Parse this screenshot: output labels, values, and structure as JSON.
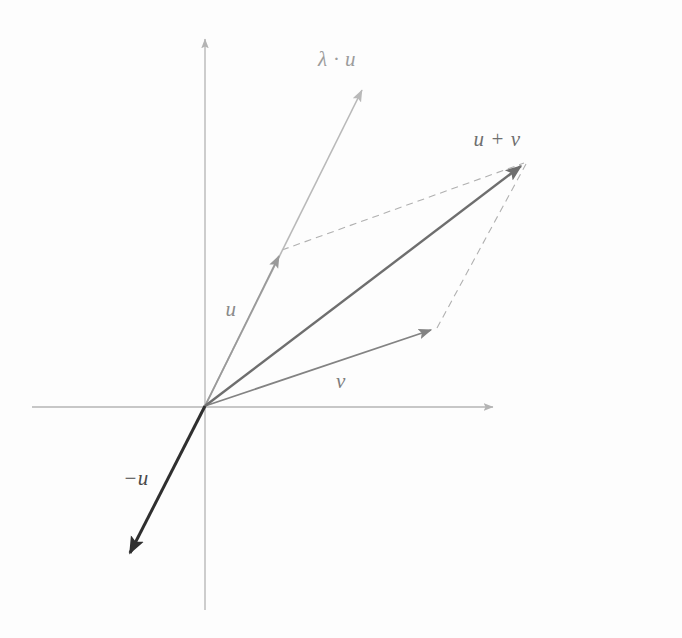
{
  "figure": {
    "background_color": "#fdfdfd",
    "width": 682,
    "height": 638
  },
  "axes": {
    "origin": {
      "x": 205,
      "y": 406
    },
    "color": "#b4b4b4",
    "x_axis": {
      "name": "horizontal-axis",
      "from": {
        "x": 32,
        "y": 407
      },
      "to": {
        "x": 497,
        "y": 407
      },
      "arrow": "right"
    },
    "y_axis": {
      "name": "vertical-axis",
      "from": {
        "x": 205,
        "y": 610
      },
      "to": {
        "x": 205,
        "y": 34
      },
      "arrow": "up"
    }
  },
  "vectors": [
    {
      "id": "lambda-u",
      "label": "λ · u",
      "label_x": 337,
      "label_y": 59,
      "from": {
        "x": 205,
        "y": 406
      },
      "to": {
        "x": 365,
        "y": 84
      },
      "color": "#b9b9b9",
      "stroke_width": 1.6,
      "dashed": false,
      "arrow": true
    },
    {
      "id": "u",
      "label": "u",
      "label_x": 231,
      "label_y": 309,
      "from": {
        "x": 205,
        "y": 406
      },
      "to": {
        "x": 282,
        "y": 250
      },
      "color": "#9a9a9a",
      "stroke_width": 1.7,
      "dashed": false,
      "arrow": true
    },
    {
      "id": "u-plus-v",
      "label": "u + v",
      "label_x": 497,
      "label_y": 139,
      "from": {
        "x": 205,
        "y": 406
      },
      "to": {
        "x": 527,
        "y": 161
      },
      "color": "#6e6e6e",
      "stroke_width": 2.4,
      "dashed": false,
      "arrow": true
    },
    {
      "id": "v",
      "label": "v",
      "label_x": 341,
      "label_y": 381,
      "from": {
        "x": 205,
        "y": 406
      },
      "to": {
        "x": 437,
        "y": 328
      },
      "color": "#838383",
      "stroke_width": 1.8,
      "dashed": false,
      "arrow": true
    },
    {
      "id": "minus-u",
      "label": "−u",
      "label_x": 136,
      "label_y": 478,
      "from": {
        "x": 205,
        "y": 406
      },
      "to": {
        "x": 124,
        "y": 565
      },
      "color": "#2f2f2f",
      "stroke_width": 3.0,
      "dashed": false,
      "arrow": true
    }
  ],
  "construction_lines": [
    {
      "id": "dashed-u-to-sum",
      "name": "dashed-line-u-to-sum",
      "from": {
        "x": 282,
        "y": 250
      },
      "to": {
        "x": 527,
        "y": 161
      },
      "color": "#b0b0b0",
      "stroke_width": 1.1,
      "dash": "7 5"
    },
    {
      "id": "dashed-v-to-sum",
      "name": "dashed-line-v-to-sum",
      "from": {
        "x": 437,
        "y": 328
      },
      "to": {
        "x": 527,
        "y": 161
      },
      "color": "#b0b0b0",
      "stroke_width": 1.1,
      "dash": "7 5"
    }
  ],
  "labels": {
    "lambda_u": "λ · u",
    "u_plus_v": "u + v",
    "u": "u",
    "v": "v",
    "minus_u": "−u"
  }
}
